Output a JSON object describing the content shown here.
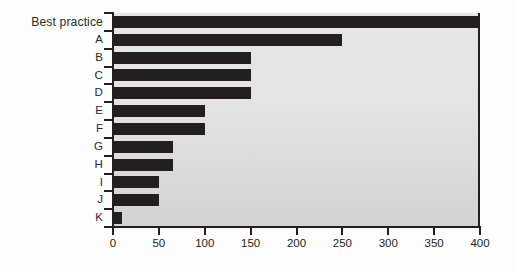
{
  "chart_data": {
    "type": "bar",
    "orientation": "horizontal",
    "title": "",
    "xlabel": "",
    "ylabel": "",
    "categories": [
      "Best practice",
      "A",
      "B",
      "C",
      "D",
      "E",
      "F",
      "G",
      "H",
      "I",
      "J",
      "K"
    ],
    "values": [
      400,
      250,
      150,
      150,
      150,
      100,
      100,
      65,
      65,
      50,
      50,
      10
    ],
    "xlim": [
      0,
      400
    ],
    "xticks": [
      0,
      50,
      100,
      150,
      200,
      250,
      300,
      350,
      400
    ],
    "xtick_labels": [
      "0",
      "50",
      "100",
      "150",
      "200",
      "250",
      "300",
      "350",
      "400"
    ],
    "grid": false,
    "legend": null,
    "bar_color": "#231f20",
    "plot_background": "#e3e3e3",
    "axis_color": "#231f20"
  }
}
